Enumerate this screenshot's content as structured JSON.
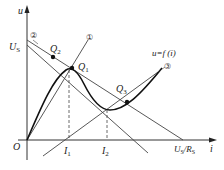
{
  "diagram": {
    "axes": {
      "y_label": "u",
      "x_label": "i",
      "origin_label": "O"
    },
    "labels": {
      "us": "U",
      "us_sub": "S",
      "q1": "Q",
      "q1_sub": "1",
      "q2": "Q",
      "q2_sub": "2",
      "q3": "Q",
      "q3_sub": "3",
      "i1": "I",
      "i1_sub": "1",
      "i2": "I",
      "i2_sub": "2",
      "us_rs": "U",
      "us_rs_sub1": "S",
      "us_rs_mid": "/R",
      "us_rs_sub2": "S",
      "curve": "u=f (i)",
      "line1": "①",
      "line2": "②",
      "line3": "③"
    }
  }
}
